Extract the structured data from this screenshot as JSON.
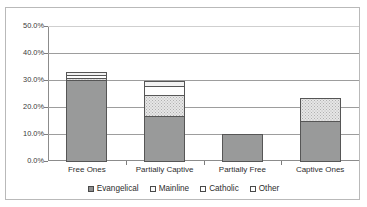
{
  "chart_data": {
    "type": "bar",
    "title": "",
    "subtitle": "",
    "xlabel": "",
    "ylabel": "",
    "stacked": true,
    "grid": true,
    "legend_position": "bottom",
    "ylim": [
      0,
      50
    ],
    "ytick_values": [
      0,
      10,
      20,
      30,
      40,
      50
    ],
    "ytick_labels": [
      "0.0%",
      "10.0%",
      "20.0%",
      "30.0%",
      "40.0%",
      "50.0%"
    ],
    "categories": [
      "Free Ones",
      "Partially Captive",
      "Partially Free",
      "Captive Ones"
    ],
    "series": [
      {
        "name": "Evangelical",
        "values": [
          30.3,
          17.0,
          10.4,
          15.2
        ],
        "color": "#999a9a"
      },
      {
        "name": "Mainline",
        "values": [
          1.2,
          8.3,
          0.0,
          8.9
        ],
        "color": "#e6e6e6"
      },
      {
        "name": "Catholic",
        "values": [
          1.3,
          3.7,
          0.0,
          0.0
        ],
        "color": "#fdfdfd"
      },
      {
        "name": "Other",
        "values": [
          1.5,
          2.0,
          0.0,
          0.0
        ],
        "color": "#f2f2f2"
      }
    ],
    "totals": [
      34.3,
      31.0,
      10.4,
      24.1
    ]
  },
  "legend": {
    "items": [
      {
        "label": "Evangelical"
      },
      {
        "label": "Mainline"
      },
      {
        "label": "Catholic"
      },
      {
        "label": "Other"
      }
    ]
  }
}
